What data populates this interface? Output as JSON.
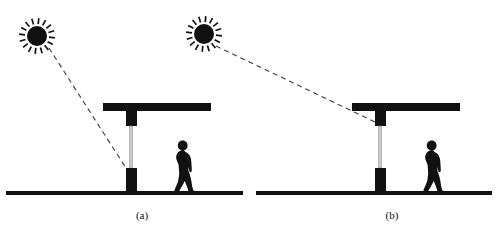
{
  "figure": {
    "type": "line-diagram",
    "background_color": "#ffffff",
    "ink_color": "#111111",
    "dash_color": "#3a3a3a",
    "pole_shaft_color": "#c9c9c9",
    "caption_a": "(a)",
    "caption_b": "(b)",
    "panels": [
      {
        "id": "panel-a",
        "label": "(a)",
        "label_x": 142,
        "label_y": 219,
        "ground": {
          "x1": 6,
          "x2": 243,
          "y": 191,
          "thickness": 4
        },
        "sun": {
          "name": "sun-icon",
          "cx": 37,
          "cy": 36,
          "core_radius": 10,
          "ray_count": 16,
          "ray_inner": 12,
          "ray_outer": 18
        },
        "beam": {
          "x": 103,
          "y": 103,
          "width": 108,
          "height": 8
        },
        "pole": {
          "center_x": 131,
          "upper_block": {
            "x": 126,
            "y": 111,
            "width": 11,
            "height": 15
          },
          "shaft": {
            "x": 129.5,
            "y": 126,
            "width": 3,
            "height": 42
          },
          "lower_block": {
            "x": 126,
            "y": 168,
            "width": 11,
            "height": 23
          }
        },
        "sun_ray": {
          "name": "sun-ray-dashed-line",
          "x1": 49,
          "y1": 48,
          "x2": 126,
          "y2": 168,
          "dash": "5 4",
          "width": 1.1
        },
        "person": {
          "name": "pedestrian-silhouette",
          "x": 168,
          "y": 140,
          "width": 28,
          "height": 52,
          "facing": "right"
        }
      },
      {
        "id": "panel-b",
        "label": "(b)",
        "label_x": 392,
        "label_y": 219,
        "ground": {
          "x1": 256,
          "x2": 492,
          "y": 191,
          "thickness": 4
        },
        "sun": {
          "name": "sun-icon",
          "cx": 204,
          "cy": 34,
          "core_radius": 10,
          "ray_count": 16,
          "ray_inner": 12,
          "ray_outer": 18
        },
        "beam": {
          "x": 352,
          "y": 103,
          "width": 108,
          "height": 8
        },
        "pole": {
          "center_x": 380,
          "upper_block": {
            "x": 375,
            "y": 111,
            "width": 11,
            "height": 15
          },
          "shaft": {
            "x": 378.5,
            "y": 126,
            "width": 3,
            "height": 42
          },
          "lower_block": {
            "x": 375,
            "y": 168,
            "width": 11,
            "height": 23
          }
        },
        "sun_ray": {
          "name": "sun-ray-dashed-line",
          "x1": 216,
          "y1": 46,
          "x2": 375,
          "y2": 122,
          "dash": "5 4",
          "width": 1.1
        },
        "person": {
          "name": "pedestrian-silhouette",
          "x": 417,
          "y": 140,
          "width": 28,
          "height": 52,
          "facing": "right"
        }
      }
    ]
  }
}
